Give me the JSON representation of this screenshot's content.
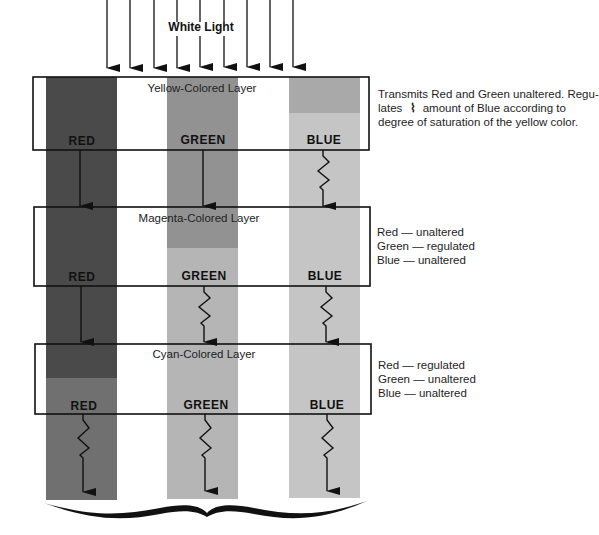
{
  "diagram": {
    "incoming_light_label": "White Light",
    "channels": [
      "RED",
      "GREEN",
      "BLUE"
    ],
    "colors": {
      "red_strip_full": "#4a4a4a",
      "red_strip_reduced": "#707070",
      "green_strip_full": "#929292",
      "green_strip_reduced": "#b5b5b5",
      "blue_strip_full": "#a9a9a9",
      "blue_strip_reduced": "#c5c5c5",
      "line": "#111111"
    },
    "layers": [
      {
        "title": "Yellow-Colored Layer",
        "labels": [
          "RED",
          "GREEN",
          "BLUE"
        ],
        "outputs": [
          "straight",
          "straight",
          "regulated"
        ],
        "note_lines": [
          "Transmits Red and Green unaltered. Regu-",
          "amount of Blue according to",
          "degree of saturation of the yellow color."
        ],
        "note_prefix": "lates",
        "note_glyph": "⌇"
      },
      {
        "title": "Magenta-Colored Layer",
        "labels": [
          "RED",
          "GREEN",
          "BLUE"
        ],
        "outputs": [
          "straight",
          "regulated",
          "regulated"
        ],
        "note_lines": [
          "Red — unaltered",
          "Green — regulated",
          "Blue — unaltered"
        ]
      },
      {
        "title": "Cyan-Colored Layer",
        "labels": [
          "RED",
          "GREEN",
          "BLUE"
        ],
        "outputs": [
          "regulated",
          "regulated",
          "regulated"
        ],
        "note_lines": [
          "Red — regulated",
          "Green — unaltered",
          "Blue — unaltered"
        ]
      }
    ]
  }
}
